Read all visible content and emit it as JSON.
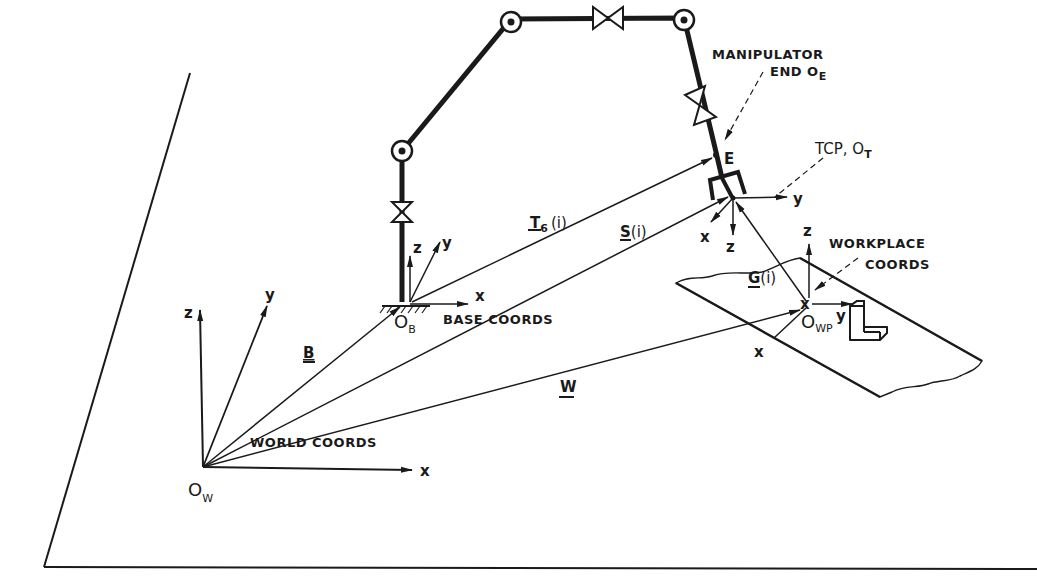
{
  "diagram": {
    "frames": {
      "world": {
        "origin_label": "O",
        "origin_sub": "W",
        "caption": "WORLD COORDS",
        "axes": [
          "x",
          "y",
          "z"
        ]
      },
      "base": {
        "origin_label": "O",
        "origin_sub": "B",
        "caption": "BASE COORDS",
        "axes": [
          "x",
          "y",
          "z"
        ]
      },
      "manipulator_end": {
        "caption_line1": "MANIPULATOR",
        "caption_line2": "END O",
        "caption_sub": "E",
        "point_label": "E"
      },
      "tcp": {
        "caption": "TCP, O",
        "caption_sub": "T",
        "axes": [
          "x",
          "y",
          "z"
        ]
      },
      "workplace": {
        "origin_label": "O",
        "origin_sub": "WP",
        "caption_line1": "WORKPLACE",
        "caption_line2": "COORDS",
        "axes": [
          "x",
          "y",
          "z"
        ],
        "origin_mark": "x"
      }
    },
    "vectors": [
      {
        "id": "B",
        "label": "B",
        "args": ""
      },
      {
        "id": "T6",
        "label": "T",
        "sub": "6",
        "args": "(i)"
      },
      {
        "id": "S",
        "label": "S",
        "args": "(i)"
      },
      {
        "id": "G",
        "label": "G",
        "args": "(i)"
      },
      {
        "id": "W",
        "label": "W",
        "args": ""
      }
    ]
  }
}
